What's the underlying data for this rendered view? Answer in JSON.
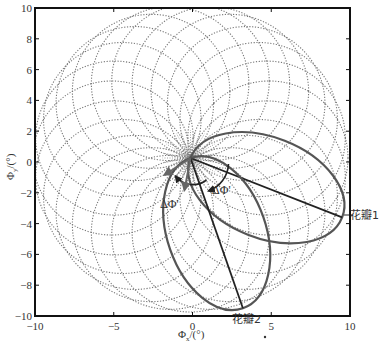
{
  "chart_data": {
    "type": "line",
    "title": "",
    "xlabel": "Φx/(°)",
    "ylabel": "Φy/(°)",
    "xlim": [
      -10,
      10
    ],
    "ylim": [
      -10,
      10
    ],
    "x_ticks": [
      -10,
      -5,
      0,
      5,
      10
    ],
    "x_tick_labels": [
      "-10",
      "-5",
      "0",
      "5",
      "10"
    ],
    "y_ticks": [
      -10,
      -8,
      -6,
      -4,
      -2,
      0,
      2,
      4,
      6,
      8,
      10
    ],
    "y_tick_labels": [
      "-10",
      "-8",
      "-6",
      "-4",
      "-2",
      "0",
      "2",
      "4",
      "6",
      "8",
      "10"
    ],
    "grid": false,
    "legend": null,
    "petal_count": 24,
    "petal_diameter": 10,
    "series": [
      {
        "name": "rosette petals",
        "style": "dotted",
        "color": "#777777"
      },
      {
        "name": "花瓣1",
        "style": "solid-thick",
        "color": "#555555",
        "chord_end": [
          9.5,
          -3.6
        ],
        "direction_deg": -21
      },
      {
        "name": "花瓣2",
        "style": "solid-thick",
        "color": "#555555",
        "chord_end": [
          3.2,
          -9.5
        ],
        "direction_deg": -71
      }
    ],
    "annotations": [
      {
        "text": "ΔΦ'",
        "x": -1.4,
        "y": -3.2,
        "kind": "angle-arc"
      },
      {
        "text": "ΔΦ'",
        "x": 1.6,
        "y": -2.4,
        "kind": "angle-arc"
      },
      {
        "text": "花瓣1",
        "x": 10.0,
        "y": -3.6,
        "kind": "callout"
      },
      {
        "text": "花瓣2",
        "x": 3.2,
        "y": -10.0,
        "kind": "callout"
      }
    ]
  },
  "labels": {
    "xlabel_main": "Φ",
    "xlabel_sub": "x",
    "xlabel_unit": "/(°)",
    "ylabel_main": "Φ",
    "ylabel_sub": "y",
    "ylabel_unit": "/(°)",
    "delta1": "ΔΦ'",
    "delta2": "ΔΦ'",
    "petal1": "花瓣1",
    "petal2": "花瓣2"
  },
  "colors": {
    "frame": "#111111",
    "dotted": "#777777",
    "highlight": "#555555",
    "chord": "#222222"
  }
}
